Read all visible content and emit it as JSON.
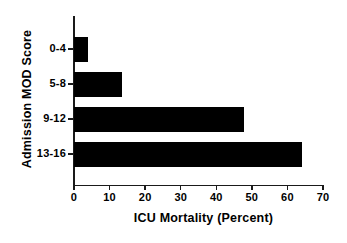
{
  "chart_data": {
    "type": "bar",
    "orientation": "horizontal",
    "title": "",
    "xlabel": "ICU Mortality (Percent)",
    "ylabel": "Admission MOD Score",
    "categories": [
      "0-4",
      "5-8",
      "9-12",
      "13-16"
    ],
    "values": [
      4,
      13.4,
      47.8,
      64
    ],
    "xlim": [
      0,
      70
    ],
    "xticks": [
      0,
      10,
      20,
      30,
      40,
      50,
      60,
      70
    ],
    "xtick_labels": [
      "0",
      "10",
      "20",
      "30",
      "40",
      "50",
      "60",
      "70"
    ],
    "grid": false,
    "legend": false,
    "bar_color": "#000000",
    "axis_color": "#1a1a1a",
    "background_color": "#ffffff"
  }
}
